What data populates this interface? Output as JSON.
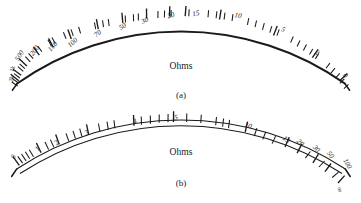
{
  "figure": {
    "background_color": "#ffffff",
    "ink_color": "#1a1a1a"
  },
  "chart_data": {
    "type": "scatter",
    "title": "",
    "xlabel": "",
    "ylabel": "",
    "panels": [
      {
        "id": "a",
        "caption": "(a)",
        "unit_label": "Ohms",
        "arc_style": "single-thick",
        "tick_direction": "outward",
        "scale_direction": "right-to-left-increasing",
        "zero_side": "right",
        "infinity_side": "left",
        "labels": [
          "2k",
          "1k",
          "500",
          "200",
          "150",
          "100",
          "70",
          "50",
          "30",
          "20",
          "15",
          "10",
          "5",
          "2",
          "0"
        ],
        "label_values": [
          2000,
          1000,
          500,
          200,
          150,
          100,
          70,
          50,
          30,
          20,
          15,
          10,
          5,
          2,
          0
        ],
        "label_angles_deg": [
          182.5,
          180.0,
          176.5,
          171.0,
          167.5,
          162.0,
          152.0,
          143.0,
          133.0,
          123.5,
          117.0,
          103.0,
          79.5,
          55.0,
          31.0
        ],
        "minor_tick_angles_deg": [
          184.0,
          183.2,
          181.5,
          178.5,
          177.5,
          174.5,
          173.0,
          169.0,
          165.0,
          163.5,
          159.5,
          157.0,
          154.5,
          149.5,
          147.0,
          145.2,
          140.0,
          137.5,
          136.0,
          130.0,
          128.0,
          126.0,
          120.5,
          114.5,
          112.0,
          109.5,
          107.0,
          99.0,
          95.0,
          91.0,
          87.0,
          83.0,
          75.5,
          71.5,
          67.5,
          63.5,
          59.5,
          51.0,
          47.0,
          43.0,
          39.0,
          35.0
        ],
        "axis_range": [
          0,
          2000
        ],
        "grid": false
      },
      {
        "id": "b",
        "caption": "(b)",
        "unit_label": "Ohms",
        "arc_style": "double-line",
        "tick_direction": "outward",
        "scale_direction": "left-to-right-increasing",
        "zero_side": "left",
        "infinity_side": "right",
        "labels": [
          "0",
          "1",
          "2",
          "3",
          "4",
          "5",
          "10",
          "15",
          "20",
          "30",
          "50",
          "100",
          "∞"
        ],
        "label_values": [
          0,
          1,
          2,
          3,
          4,
          5,
          10,
          15,
          20,
          30,
          50,
          100,
          null
        ],
        "label_angles_deg": [
          168.0,
          158.0,
          150.0,
          138.0,
          120.0,
          104.0,
          70.0,
          52.0,
          46.0,
          39.0,
          33.0,
          25.0,
          14.0
        ],
        "minor_tick_angles_deg": [
          165.0,
          163.0,
          161.0,
          154.0,
          146.0,
          142.0,
          133.0,
          129.0,
          125.0,
          115.0,
          111.0,
          108.0,
          99.0,
          94.0,
          89.0,
          84.0,
          79.0,
          74.0,
          65.0,
          61.0,
          57.5,
          49.0,
          43.0,
          36.0,
          29.0,
          21.0,
          17.0
        ],
        "axis_range": [
          0,
          null
        ],
        "grid": false
      }
    ],
    "legend_position": "none"
  },
  "panel_a": {
    "caption": "(a)",
    "unit": "Ohms",
    "labels": [
      {
        "text": "2k",
        "x": 12,
        "y": 79,
        "rot": -78,
        "size": "tiny"
      },
      {
        "text": "1k",
        "x": 13,
        "y": 69,
        "rot": -78,
        "size": "tiny"
      },
      {
        "text": "500",
        "x": 20,
        "y": 56,
        "rot": -58,
        "size": "small"
      },
      {
        "text": "200",
        "x": 35,
        "y": 51,
        "rot": -52,
        "size": "small"
      },
      {
        "text": "150",
        "x": 53,
        "y": 47,
        "rot": -48,
        "size": "small"
      },
      {
        "text": "100",
        "x": 73,
        "y": 43,
        "rot": -44,
        "size": "small"
      },
      {
        "text": "70",
        "x": 98,
        "y": 34,
        "rot": -38,
        "size": "small"
      },
      {
        "text": "50",
        "x": 123,
        "y": 27,
        "rot": -32,
        "size": "small"
      },
      {
        "text": "30",
        "x": 145,
        "y": 21,
        "rot": -25,
        "size": "small"
      },
      {
        "text": "20",
        "x": 171,
        "y": 16,
        "rot": -16,
        "size": "small"
      },
      {
        "text": "15",
        "x": 196,
        "y": 14,
        "rot": -10,
        "size": "small"
      },
      {
        "text": "10",
        "x": 238,
        "y": 16,
        "rot": 10,
        "size": "small"
      },
      {
        "text": "5",
        "x": 283,
        "y": 30,
        "rot": 24,
        "size": "small"
      },
      {
        "text": "2",
        "x": 317,
        "y": 53,
        "rot": 36,
        "size": "small"
      },
      {
        "text": "0",
        "x": 345,
        "y": 76,
        "rot": 48,
        "size": "small"
      }
    ]
  },
  "panel_b": {
    "caption": "(b)",
    "unit": "Ohms",
    "labels": [
      {
        "text": "0",
        "x": 14,
        "y": 157,
        "rot": -62,
        "size": "small"
      },
      {
        "text": "1",
        "x": 38,
        "y": 149,
        "rot": -50,
        "size": "small"
      },
      {
        "text": "2",
        "x": 57,
        "y": 143,
        "rot": -44,
        "size": "small"
      },
      {
        "text": "3",
        "x": 87,
        "y": 133,
        "rot": -36,
        "size": "small"
      },
      {
        "text": "4",
        "x": 135,
        "y": 122,
        "rot": -18,
        "size": "small"
      },
      {
        "text": "5",
        "x": 176,
        "y": 118,
        "rot": -6,
        "size": "small"
      },
      {
        "text": "10",
        "x": 248,
        "y": 126,
        "rot": 22,
        "size": "small"
      },
      {
        "text": "15",
        "x": 286,
        "y": 140,
        "rot": 38,
        "size": "small"
      },
      {
        "text": "20",
        "x": 300,
        "y": 143,
        "rot": 42,
        "size": "small"
      },
      {
        "text": "30",
        "x": 316,
        "y": 149,
        "rot": 48,
        "size": "small"
      },
      {
        "text": "50",
        "x": 330,
        "y": 155,
        "rot": 52,
        "size": "small"
      },
      {
        "text": "100",
        "x": 347,
        "y": 164,
        "rot": 60,
        "size": "small"
      },
      {
        "text": "∞",
        "x": 339,
        "y": 190,
        "rot": 72,
        "size": "small"
      }
    ]
  }
}
